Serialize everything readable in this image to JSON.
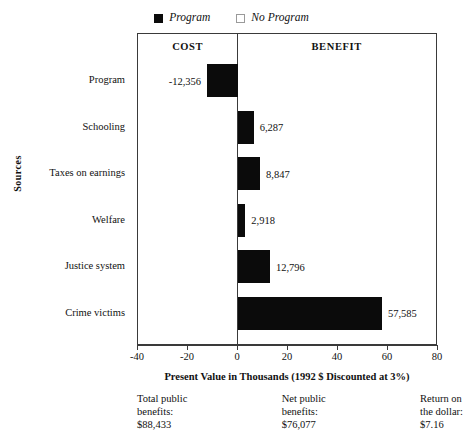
{
  "legend": {
    "items": [
      {
        "label": "Program",
        "marker": "filled-square-icon",
        "color": "#0b0b0b"
      },
      {
        "label": "No Program",
        "marker": "empty-square-icon",
        "color": "#ffffff"
      }
    ]
  },
  "panels": {
    "cost_label": "COST",
    "benefit_label": "BENEFIT"
  },
  "chart_data": {
    "type": "bar",
    "orientation": "horizontal",
    "title": "",
    "xlabel": "Present Value in Thousands (1992 $ Discounted at 3%)",
    "ylabel": "Sources",
    "xlim": [
      -40,
      80
    ],
    "xticks": [
      -40,
      -20,
      0,
      20,
      40,
      60,
      80
    ],
    "xtick_labels": [
      "-40",
      "-20",
      "0",
      "20",
      "40",
      "60",
      "80"
    ],
    "grid": false,
    "legend_position": "top-center",
    "bar_color": "#0b0b0b",
    "categories": [
      "Program",
      "Schooling",
      "Taxes on earnings",
      "Welfare",
      "Justice system",
      "Crime victims"
    ],
    "values": [
      -12.356,
      6.287,
      8.847,
      2.918,
      12.796,
      57.585
    ],
    "value_labels": [
      "-12,356",
      "6,287",
      "8,847",
      "2,918",
      "12,796",
      "57,585"
    ],
    "series": [
      {
        "name": "Program",
        "values": [
          -12.356,
          6.287,
          8.847,
          2.918,
          12.796,
          57.585
        ]
      }
    ]
  },
  "summary": [
    {
      "title_line1": "Total public",
      "title_line2": "benefits:",
      "value": "$88,433"
    },
    {
      "title_line1": "Net public",
      "title_line2": "benefits:",
      "value": "$76,077"
    },
    {
      "title_line1": "Return on",
      "title_line2": "the dollar:",
      "value": "$7.16"
    }
  ]
}
